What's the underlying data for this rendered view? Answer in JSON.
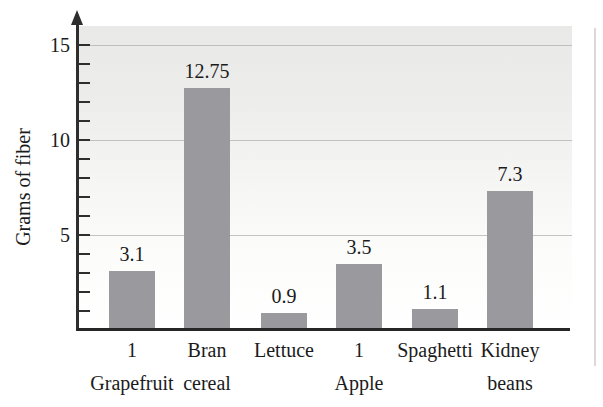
{
  "chart_data": {
    "type": "bar",
    "title": "",
    "xlabel": "",
    "ylabel": "Grams of fiber",
    "categories": [
      "1 Grapefruit",
      "Bran cereal",
      "Lettuce",
      "1 Apple",
      "Spaghetti",
      "Kidney beans"
    ],
    "category_lines": [
      [
        "1",
        "Grapefruit"
      ],
      [
        "Bran",
        "cereal"
      ],
      [
        "Lettuce"
      ],
      [
        "1",
        "Apple"
      ],
      [
        "Spaghetti"
      ],
      [
        "Kidney",
        "beans"
      ]
    ],
    "values": [
      3.1,
      12.75,
      0.9,
      3.5,
      1.1,
      7.3
    ],
    "value_labels": [
      "3.1",
      "12.75",
      "0.9",
      "3.5",
      "1.1",
      "7.3"
    ],
    "ylim": [
      0,
      16
    ],
    "yticks_labeled": [
      5,
      10,
      15
    ],
    "ytick_labels": [
      "5",
      "10",
      "15"
    ],
    "minor_tick_step": 1,
    "grid": true,
    "legend_position": null,
    "colors": {
      "bar": "#9a999d",
      "axis": "#2e2e2e",
      "gridline": "#b0b0af",
      "text": "#1b1b1b",
      "plot_background_top": "#e9e9e7",
      "page_background": "#ffffff",
      "page_edge_line": "#d9d9d8"
    }
  }
}
